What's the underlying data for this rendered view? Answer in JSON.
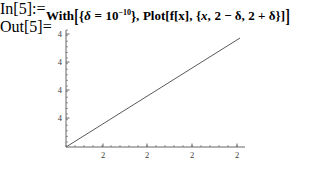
{
  "notebook": {
    "background_color": "#ffffff",
    "input_cell": {
      "label": "In[5]:=",
      "expression_text": "With[{δ = 10⁻¹⁰}, Plot[f[x], {x, 2 − δ, 2 + δ}]]",
      "tokens": {
        "head": "With",
        "bracket_open": "[",
        "brace_open": "{",
        "delta_symbol": "δ",
        "equals": "=",
        "base": "10",
        "exponent": "−10",
        "brace_close": "}",
        "comma1": ",",
        "plot_head": "Plot",
        "plot_bracket_open": "[",
        "function": "f[x]",
        "comma2": ",",
        "iterator_brace_open": "{",
        "var": "x",
        "comma3": ",",
        "lower_bound": "2 − δ",
        "comma4": ",",
        "upper_bound": "2 + δ",
        "iterator_brace_close": "}",
        "plot_bracket_close": "]",
        "bracket_close": "]"
      }
    },
    "output_cell": {
      "label": "Out[5]="
    }
  },
  "chart_data": {
    "type": "line",
    "title": "",
    "xlabel": "",
    "ylabel": "",
    "grid": false,
    "legend": null,
    "axis_color": "#555555",
    "line_color": "#5a5a5a",
    "xlim": [
      0,
      200
    ],
    "ylim": [
      0,
      140
    ],
    "x_tick_labels": [
      "2",
      "2",
      "2",
      "2"
    ],
    "x_tick_positions": [
      45,
      89,
      134,
      179
    ],
    "y_tick_labels": [
      "4",
      "4",
      "4",
      "4"
    ],
    "y_tick_positions": [
      8,
      36,
      64,
      92
    ],
    "x_minor_tick_spacing": 9,
    "y_minor_tick_spacing": 5.6,
    "series": [
      {
        "name": "f[x]",
        "x": [
          8,
          182
        ],
        "values": [
          0,
          109
        ]
      }
    ]
  }
}
